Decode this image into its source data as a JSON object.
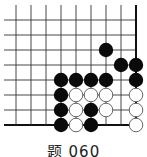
{
  "diagram": {
    "type": "go-problem",
    "caption": "题 060",
    "colors": {
      "line": "#333333",
      "edge": "#111111",
      "black_stone": "#0a0a0a",
      "white_stone": "#ffffff",
      "white_stroke": "#555555"
    },
    "grid": {
      "columns_x": [
        16,
        31,
        46,
        61,
        76,
        91,
        106,
        121,
        136
      ],
      "rows_y": [
        20,
        35,
        50,
        65,
        80,
        95,
        110,
        125
      ],
      "line_start_x": 4,
      "line_start_y": 5,
      "right_edge_col": 8,
      "bottom_edge_row": 7
    },
    "stones": [
      {
        "color": "black",
        "col": 6,
        "row": 2
      },
      {
        "color": "black",
        "col": 7,
        "row": 3
      },
      {
        "color": "black",
        "col": 8,
        "row": 3
      },
      {
        "color": "black",
        "col": 3,
        "row": 4
      },
      {
        "color": "black",
        "col": 4,
        "row": 4
      },
      {
        "color": "black",
        "col": 5,
        "row": 4
      },
      {
        "color": "black",
        "col": 6,
        "row": 4
      },
      {
        "color": "black",
        "col": 8,
        "row": 4
      },
      {
        "color": "black",
        "col": 3,
        "row": 5
      },
      {
        "color": "white",
        "col": 4,
        "row": 5
      },
      {
        "color": "white",
        "col": 5,
        "row": 5
      },
      {
        "color": "white",
        "col": 6,
        "row": 5
      },
      {
        "color": "white",
        "col": 8,
        "row": 5
      },
      {
        "color": "black",
        "col": 3,
        "row": 6
      },
      {
        "color": "white",
        "col": 4,
        "row": 6
      },
      {
        "color": "black",
        "col": 5,
        "row": 6
      },
      {
        "color": "white",
        "col": 6,
        "row": 6
      },
      {
        "color": "white",
        "col": 8,
        "row": 6
      },
      {
        "color": "black",
        "col": 3,
        "row": 7
      },
      {
        "color": "white",
        "col": 4,
        "row": 7
      },
      {
        "color": "black",
        "col": 5,
        "row": 7
      },
      {
        "color": "white",
        "col": 8,
        "row": 7
      }
    ]
  }
}
